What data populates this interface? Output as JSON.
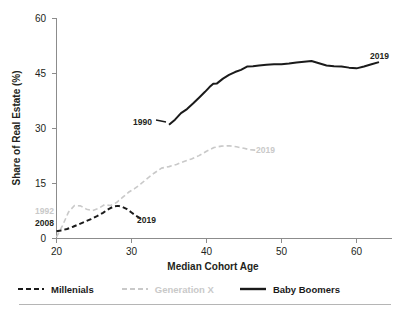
{
  "chart_data": {
    "type": "line",
    "title": "",
    "xlabel": "Median Cohort Age",
    "ylabel": "Share of Real Estate (%)",
    "xlim": [
      20,
      65
    ],
    "ylim": [
      0,
      60
    ],
    "xticks": [
      20,
      30,
      40,
      50,
      60
    ],
    "yticks": [
      0,
      15,
      30,
      45,
      60
    ],
    "grid": false,
    "legend_position": "below",
    "series": [
      {
        "name": "Millenials",
        "style": "dashed",
        "color": "#1a1a1a",
        "x": [
          20.0,
          20.6,
          21.4,
          22.2,
          23.0,
          23.8,
          24.6,
          25.4,
          26.2,
          27.0,
          27.6,
          28.2,
          28.8,
          29.4,
          30.0,
          30.6,
          31.2
        ],
        "y": [
          2.0,
          2.2,
          2.6,
          3.2,
          3.9,
          4.6,
          5.3,
          6.1,
          7.0,
          8.1,
          8.7,
          8.9,
          8.6,
          8.0,
          7.1,
          6.2,
          5.5
        ]
      },
      {
        "name": "Generation X",
        "style": "dashed",
        "color": "#c9c9c9",
        "x": [
          20.0,
          20.8,
          21.6,
          22.4,
          23.2,
          24.0,
          24.8,
          25.6,
          26.4,
          27.2,
          28.0,
          28.8,
          29.6,
          30.4,
          31.2,
          32.0,
          33.0,
          34.0,
          35.0,
          36.0,
          37.0,
          38.0,
          39.0,
          40.0,
          41.0,
          42.0,
          43.0,
          44.0,
          45.0,
          45.8,
          46.6
        ],
        "y": [
          0.4,
          3.5,
          7.2,
          9.0,
          8.9,
          8.0,
          7.6,
          8.2,
          9.2,
          9.0,
          9.8,
          11.2,
          12.6,
          13.6,
          14.8,
          16.2,
          17.8,
          19.2,
          19.6,
          20.2,
          21.0,
          21.7,
          22.6,
          23.8,
          24.8,
          25.2,
          25.3,
          25.0,
          24.6,
          24.2,
          24.1
        ]
      },
      {
        "name": "Baby Boomers",
        "style": "solid",
        "color": "#1a1a1a",
        "x": [
          35.0,
          35.8,
          36.6,
          37.4,
          38.2,
          39.0,
          39.8,
          40.4,
          40.9,
          41.4,
          42.2,
          43.0,
          43.8,
          44.6,
          45.4,
          46.2,
          47.0,
          48.0,
          49.0,
          50.0,
          51.0,
          52.0,
          53.0,
          54.0,
          55.0,
          56.0,
          57.0,
          58.0,
          59.0,
          60.0,
          61.0,
          62.0,
          63.0
        ],
        "y": [
          31.0,
          32.4,
          34.2,
          35.3,
          36.8,
          38.4,
          40.0,
          41.3,
          42.2,
          42.3,
          43.6,
          44.6,
          45.4,
          46.0,
          46.9,
          47.0,
          47.2,
          47.4,
          47.5,
          47.5,
          47.7,
          48.0,
          48.2,
          48.4,
          47.8,
          47.2,
          47.0,
          46.9,
          46.6,
          46.4,
          46.9,
          47.5,
          48.1
        ]
      }
    ],
    "annotations": [
      {
        "text": "2008",
        "series": "Millenials",
        "role": "start-year",
        "color": "#231f20"
      },
      {
        "text": "2019",
        "series": "Millenials",
        "role": "end-year",
        "color": "#231f20"
      },
      {
        "text": "1992",
        "series": "Generation X",
        "role": "start-year",
        "color": "#c9c9c9"
      },
      {
        "text": "2019",
        "series": "Generation X",
        "role": "end-year",
        "color": "#c9c9c9"
      },
      {
        "text": "1990",
        "series": "Baby Boomers",
        "role": "start-year",
        "color": "#231f20"
      },
      {
        "text": "2019",
        "series": "Baby Boomers",
        "role": "end-year",
        "color": "#231f20"
      }
    ]
  },
  "axes": {
    "y_title": "Share of Real Estate (%)",
    "x_title": "Median Cohort Age",
    "y_tick_labels": [
      "60",
      "45",
      "30",
      "15",
      "0"
    ],
    "x_tick_labels": [
      "20",
      "30",
      "40",
      "50",
      "60"
    ]
  },
  "annotations": {
    "millenials_start": "2008",
    "millenials_end": "2019",
    "genx_start": "1992",
    "genx_end": "2019",
    "boomers_start": "1990",
    "boomers_end": "2019"
  },
  "legend": {
    "items": [
      {
        "label": "Millenials",
        "color": "#1a1a1a",
        "style": "dashed"
      },
      {
        "label": "Generation X",
        "color": "#c9c9c9",
        "style": "dashed"
      },
      {
        "label": "Baby Boomers",
        "color": "#1a1a1a",
        "style": "solid"
      }
    ]
  },
  "colors": {
    "millenials": "#1a1a1a",
    "generation_x": "#c9c9c9",
    "baby_boomers": "#1a1a1a",
    "axis": "#8c8c8c",
    "text": "#231f20"
  }
}
